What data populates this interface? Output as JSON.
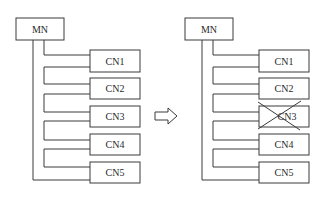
{
  "diagram": {
    "before": {
      "master": "MN",
      "children": [
        "CN1",
        "CN2",
        "CN3",
        "CN4",
        "CN5"
      ]
    },
    "transition_icon": "right-arrow-icon",
    "after": {
      "master": "MN",
      "children": [
        "CN1",
        "CN2",
        "CN3",
        "CN4",
        "CN5"
      ],
      "failed_child": "CN3",
      "failed_marker": "cross-out-icon"
    }
  }
}
